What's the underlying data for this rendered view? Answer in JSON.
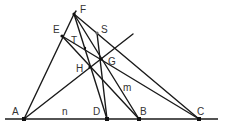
{
  "diagram": {
    "type": "geometry-construction",
    "points": [
      {
        "id": "A",
        "label": "A",
        "x": 24,
        "y": 119,
        "lx": 12,
        "ly": 115
      },
      {
        "id": "D",
        "label": "D",
        "x": 107,
        "y": 119,
        "lx": 93,
        "ly": 115
      },
      {
        "id": "B",
        "label": "B",
        "x": 139,
        "y": 119,
        "lx": 140,
        "ly": 115
      },
      {
        "id": "C",
        "label": "C",
        "x": 199,
        "y": 119,
        "lx": 197,
        "ly": 115
      },
      {
        "id": "F",
        "label": "F",
        "x": 74,
        "y": 14,
        "lx": 80,
        "ly": 13
      },
      {
        "id": "E",
        "label": "E",
        "x": 62,
        "y": 36,
        "lx": 53,
        "ly": 33
      },
      {
        "id": "S",
        "label": "S",
        "x": 97,
        "y": 33,
        "lx": 101,
        "ly": 33
      },
      {
        "id": "T",
        "label": "T",
        "x": 85,
        "y": 48,
        "lx": 71,
        "ly": 44
      },
      {
        "id": "G",
        "label": "G",
        "x": 101,
        "y": 59,
        "lx": 108,
        "ly": 65
      },
      {
        "id": "H",
        "label": "H",
        "x": 90,
        "y": 67,
        "lx": 76,
        "ly": 72
      }
    ],
    "line_labels": [
      {
        "id": "m",
        "label": "m",
        "x": 123,
        "y": 91
      },
      {
        "id": "n",
        "label": "n",
        "x": 62,
        "y": 115
      }
    ]
  }
}
